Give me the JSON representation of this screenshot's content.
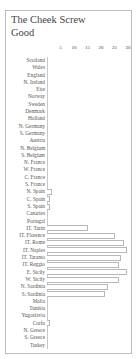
{
  "title_line1": "The Cheek Screw",
  "title_line2": "Good",
  "chart_data": {
    "type": "bar",
    "orientation": "horizontal",
    "title": "The Cheek Screw Good",
    "xlabel": "",
    "ylabel": "",
    "xlim": [
      0,
      31
    ],
    "x_ticks": [
      5,
      10,
      15,
      20,
      25,
      30
    ],
    "grid": false,
    "legend": null,
    "categories": [
      "Scotland",
      "Wales",
      "England",
      "N. Ireland",
      "Eire",
      "Norway",
      "Sweden",
      "Denmark",
      "Holland",
      "N. Germany",
      "S. Germany",
      "Austria",
      "N. Belgium",
      "S. Belgium",
      "N. France",
      "W. France",
      "C. France",
      "S. France",
      "N. Spain",
      "C. Spain",
      "S. Spain",
      "Canaries",
      "Portugal",
      "IT. Turin",
      "IT. Florence",
      "IT. Rome",
      "IT. Naples",
      "IT. Taranto",
      "IT. Reggio",
      "E. Sicily",
      "W. Sicily",
      "N. Sardinia",
      "S. Sardinia",
      "Malta",
      "Tunisia",
      "Yugoslavia",
      "Corfu",
      "N. Greece",
      "S. Greece",
      "Turkey"
    ],
    "values": [
      0,
      0,
      0,
      0,
      0,
      0,
      0,
      0,
      0,
      0,
      0,
      0,
      0,
      0,
      0,
      0,
      0,
      0,
      2,
      1,
      1,
      0,
      0,
      15,
      25,
      28.5,
      29.5,
      27.5,
      26.5,
      29.5,
      26.5,
      22.5,
      21.5,
      0,
      0,
      0,
      1,
      0,
      0,
      0
    ]
  }
}
